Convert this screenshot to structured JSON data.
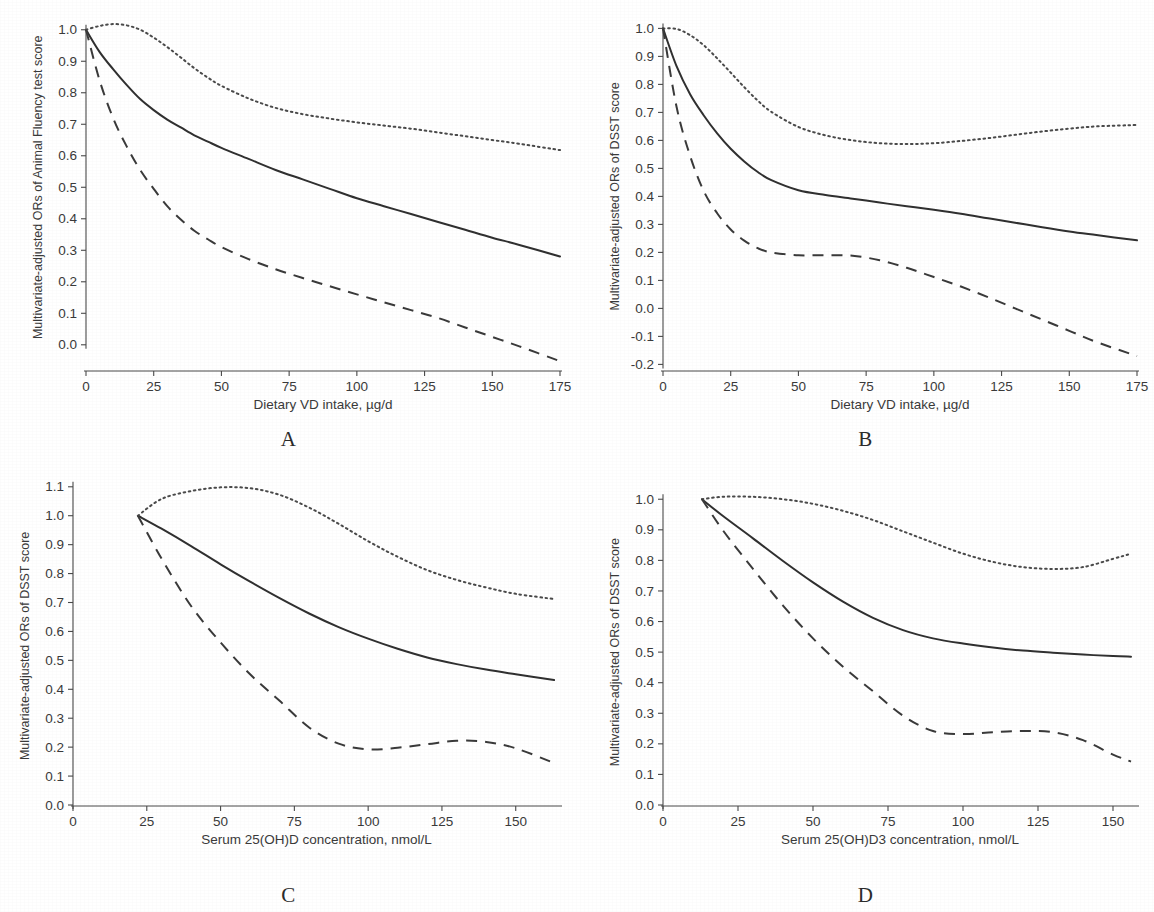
{
  "figure": {
    "panel_letters": [
      "A",
      "B",
      "C",
      "D"
    ]
  },
  "chart_data": [
    {
      "panel": "A",
      "type": "line",
      "title": "",
      "xlabel": "Dietary VD intake, µg/d",
      "ylabel": "Multivariate-adjusted ORs of Animal Fluency test score",
      "xlim": [
        0,
        175
      ],
      "ylim": [
        -0.08,
        1.05
      ],
      "xticks": [
        0,
        25,
        50,
        75,
        100,
        125,
        150,
        175
      ],
      "xticklabels": [
        "0",
        "25",
        "50",
        "75",
        "100",
        "125",
        "150",
        "175"
      ],
      "yticks": [
        0.0,
        0.1,
        0.2,
        0.3,
        0.4,
        0.5,
        0.6,
        0.7,
        0.8,
        0.9,
        1.0
      ],
      "yticklabels": [
        "0.0",
        "0.1",
        "0.2",
        "0.3",
        "0.4",
        "0.5",
        "0.6",
        "0.7",
        "0.8",
        "0.9",
        "1.0"
      ],
      "grid": false,
      "legend": null,
      "x": [
        0,
        5,
        10,
        15,
        20,
        25,
        30,
        35,
        40,
        45,
        50,
        60,
        70,
        80,
        90,
        100,
        110,
        120,
        130,
        140,
        150,
        160,
        175
      ],
      "series": [
        {
          "name": "Odds ratio (point estimate)",
          "style": "solid",
          "values": [
            1.0,
            0.93,
            0.875,
            0.825,
            0.78,
            0.745,
            0.715,
            0.69,
            0.665,
            0.645,
            0.625,
            0.59,
            0.555,
            0.525,
            0.495,
            0.465,
            0.44,
            0.415,
            0.39,
            0.365,
            0.34,
            0.317,
            0.28
          ]
        },
        {
          "name": "Upper 95% CI",
          "style": "dotted",
          "values": [
            1.0,
            1.012,
            1.018,
            1.014,
            1.0,
            0.975,
            0.945,
            0.912,
            0.878,
            0.848,
            0.822,
            0.782,
            0.752,
            0.732,
            0.718,
            0.706,
            0.696,
            0.686,
            0.674,
            0.662,
            0.65,
            0.638,
            0.618
          ]
        },
        {
          "name": "Lower 95% CI",
          "style": "dashed",
          "values": [
            1.0,
            0.84,
            0.72,
            0.63,
            0.555,
            0.495,
            0.44,
            0.398,
            0.362,
            0.335,
            0.31,
            0.272,
            0.24,
            0.212,
            0.186,
            0.16,
            0.135,
            0.11,
            0.085,
            0.055,
            0.025,
            -0.005,
            -0.052
          ]
        }
      ]
    },
    {
      "panel": "B",
      "type": "line",
      "title": "",
      "xlabel": "Dietary VD intake, µg/d",
      "ylabel": "Multivariate-adjusted ORs of DSST score",
      "xlim": [
        0,
        175
      ],
      "ylim": [
        -0.22,
        1.03
      ],
      "xticks": [
        0,
        25,
        50,
        75,
        100,
        125,
        150,
        175
      ],
      "xticklabels": [
        "0",
        "25",
        "50",
        "75",
        "100",
        "125",
        "150",
        "175"
      ],
      "yticks": [
        -0.2,
        -0.1,
        0.0,
        0.1,
        0.2,
        0.3,
        0.4,
        0.5,
        0.6,
        0.7,
        0.8,
        0.9,
        1.0
      ],
      "yticklabels": [
        "-0.2",
        "-0.1",
        "0.0",
        "0.1",
        "0.2",
        "0.3",
        "0.4",
        "0.5",
        "0.6",
        "0.7",
        "0.8",
        "0.9",
        "1.0"
      ],
      "grid": false,
      "legend": null,
      "x": [
        0,
        5,
        10,
        15,
        20,
        25,
        30,
        35,
        40,
        50,
        60,
        70,
        80,
        90,
        100,
        110,
        120,
        130,
        140,
        150,
        160,
        175
      ],
      "series": [
        {
          "name": "Odds ratio (point estimate)",
          "style": "solid",
          "values": [
            1.0,
            0.865,
            0.765,
            0.69,
            0.625,
            0.57,
            0.525,
            0.487,
            0.458,
            0.422,
            0.405,
            0.392,
            0.378,
            0.365,
            0.352,
            0.338,
            0.322,
            0.306,
            0.29,
            0.275,
            0.262,
            0.243
          ]
        },
        {
          "name": "Upper 95% CI",
          "style": "dotted",
          "values": [
            1.0,
            0.998,
            0.976,
            0.94,
            0.893,
            0.842,
            0.79,
            0.742,
            0.702,
            0.648,
            0.618,
            0.6,
            0.59,
            0.587,
            0.59,
            0.598,
            0.608,
            0.62,
            0.632,
            0.642,
            0.65,
            0.655
          ]
        },
        {
          "name": "Lower 95% CI",
          "style": "dashed",
          "values": [
            1.0,
            0.72,
            0.545,
            0.42,
            0.34,
            0.282,
            0.242,
            0.215,
            0.2,
            0.19,
            0.19,
            0.188,
            0.172,
            0.145,
            0.112,
            0.078,
            0.04,
            0.0,
            -0.04,
            -0.08,
            -0.12,
            -0.17
          ]
        }
      ]
    },
    {
      "panel": "C",
      "type": "line",
      "title": "",
      "xlabel": "Serum 25(OH)D concentration, nmol/L",
      "ylabel": "Multivariate-adjusted ORs of DSST score",
      "xlim": [
        0,
        165
      ],
      "ylim": [
        0.0,
        1.12
      ],
      "xticks": [
        0,
        25,
        50,
        75,
        100,
        125,
        150
      ],
      "xticklabels": [
        "0",
        "25",
        "50",
        "75",
        "100",
        "125",
        "150"
      ],
      "yticks": [
        0.0,
        0.1,
        0.2,
        0.3,
        0.4,
        0.5,
        0.6,
        0.7,
        0.8,
        0.9,
        1.0,
        1.1
      ],
      "yticklabels": [
        "0.0",
        "0.1",
        "0.2",
        "0.3",
        "0.4",
        "0.5",
        "0.6",
        "0.7",
        "0.8",
        "0.9",
        "1.0",
        "1.1"
      ],
      "grid": false,
      "legend": null,
      "x": [
        22,
        30,
        40,
        50,
        60,
        70,
        80,
        90,
        100,
        110,
        120,
        130,
        140,
        150,
        163
      ],
      "series": [
        {
          "name": "Odds ratio (point estimate)",
          "style": "solid",
          "values": [
            1.0,
            0.955,
            0.895,
            0.832,
            0.772,
            0.715,
            0.662,
            0.615,
            0.575,
            0.54,
            0.51,
            0.487,
            0.468,
            0.452,
            0.432
          ]
        },
        {
          "name": "Upper 95% CI",
          "style": "dotted",
          "values": [
            1.0,
            1.058,
            1.085,
            1.098,
            1.095,
            1.072,
            1.028,
            0.972,
            0.912,
            0.858,
            0.812,
            0.778,
            0.752,
            0.73,
            0.712
          ]
        },
        {
          "name": "Lower 95% CI",
          "style": "dashed",
          "values": [
            1.0,
            0.852,
            0.688,
            0.562,
            0.452,
            0.36,
            0.268,
            0.212,
            0.192,
            0.198,
            0.21,
            0.222,
            0.218,
            0.196,
            0.145
          ]
        }
      ]
    },
    {
      "panel": "D",
      "type": "line",
      "title": "",
      "xlabel": "Serum 25(OH)D3 concentration, nmol/L",
      "ylabel": "Multivariate-adjusted ORs of DSST score",
      "xlim": [
        0,
        158
      ],
      "ylim": [
        0.0,
        1.04
      ],
      "xticks": [
        0,
        25,
        50,
        75,
        100,
        125,
        150
      ],
      "xticklabels": [
        "0",
        "25",
        "50",
        "75",
        "100",
        "125",
        "150"
      ],
      "yticks": [
        0.0,
        0.1,
        0.2,
        0.3,
        0.4,
        0.5,
        0.6,
        0.7,
        0.8,
        0.9,
        1.0
      ],
      "yticklabels": [
        "0.0",
        "0.1",
        "0.2",
        "0.3",
        "0.4",
        "0.5",
        "0.6",
        "0.7",
        "0.8",
        "0.9",
        "1.0"
      ],
      "grid": false,
      "legend": null,
      "x": [
        13,
        20,
        30,
        40,
        50,
        60,
        70,
        80,
        90,
        100,
        110,
        120,
        130,
        140,
        150,
        156
      ],
      "series": [
        {
          "name": "Odds ratio (point estimate)",
          "style": "solid",
          "values": [
            1.0,
            0.945,
            0.872,
            0.798,
            0.728,
            0.665,
            0.612,
            0.572,
            0.545,
            0.528,
            0.515,
            0.505,
            0.498,
            0.492,
            0.487,
            0.485
          ]
        },
        {
          "name": "Upper 95% CI",
          "style": "dotted",
          "values": [
            1.0,
            1.008,
            1.008,
            1.0,
            0.985,
            0.962,
            0.932,
            0.895,
            0.858,
            0.822,
            0.795,
            0.778,
            0.772,
            0.778,
            0.805,
            0.822
          ]
        },
        {
          "name": "Lower 95% CI",
          "style": "dashed",
          "values": [
            1.0,
            0.898,
            0.772,
            0.652,
            0.545,
            0.452,
            0.372,
            0.292,
            0.242,
            0.232,
            0.238,
            0.242,
            0.238,
            0.212,
            0.165,
            0.142
          ]
        }
      ]
    }
  ]
}
